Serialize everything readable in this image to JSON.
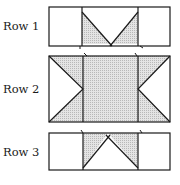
{
  "rows": [
    {
      "label": "Row 1"
    },
    {
      "label": "Row 2"
    },
    {
      "label": "Row 3"
    }
  ],
  "colors": {
    "stroke": "#1a1a1a",
    "fill": "#d9d9d9",
    "background": "#ffffff"
  }
}
